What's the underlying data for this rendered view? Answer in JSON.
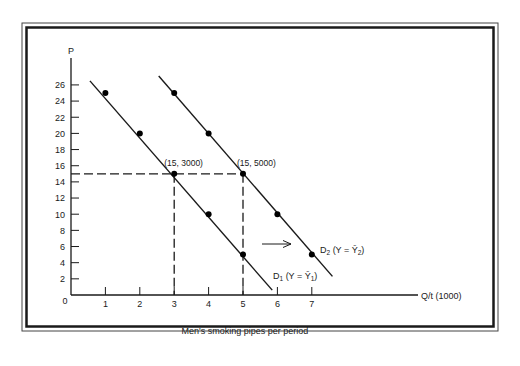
{
  "chart_data": {
    "type": "line",
    "title": "",
    "xlabel": "Men's smoking pipes per period",
    "x_axis_label": "Q/t (1000)",
    "y_axis_label": "P",
    "xlim": [
      0,
      8
    ],
    "ylim": [
      0,
      28
    ],
    "x_ticks": [
      1,
      2,
      3,
      4,
      5,
      6,
      7
    ],
    "y_ticks": [
      2,
      4,
      6,
      8,
      10,
      12,
      14,
      16,
      18,
      20,
      22,
      24,
      26
    ],
    "origin_label": "0",
    "grid": false,
    "series": [
      {
        "name": "D1 (Y = Ȳ1)",
        "label_main": "D",
        "label_sub": "1",
        "label_rest": " (Y = Ȳ",
        "label_sub2": "1",
        "label_end": ")",
        "line": [
          [
            0.55,
            26.5
          ],
          [
            5.85,
            0.6
          ]
        ],
        "points": [
          [
            1,
            25
          ],
          [
            2,
            20
          ],
          [
            3,
            15
          ],
          [
            4,
            10
          ],
          [
            5,
            5
          ]
        ]
      },
      {
        "name": "D2 (Y = Ȳ2)",
        "label_main": "D",
        "label_sub": "2",
        "label_rest": " (Y = Ȳ",
        "label_sub2": "2",
        "label_end": ")",
        "line": [
          [
            2.55,
            27.1
          ],
          [
            7.6,
            2.3
          ]
        ],
        "points": [
          [
            3,
            25
          ],
          [
            4,
            20
          ],
          [
            5,
            15
          ],
          [
            6,
            10
          ],
          [
            7,
            5
          ]
        ]
      }
    ],
    "annotations": [
      {
        "text": "(15, 3000)",
        "x": 3,
        "y": 15
      },
      {
        "text": "(15, 5000)",
        "x": 5,
        "y": 15
      }
    ],
    "reference_lines": {
      "horizontal": {
        "y": 15,
        "x_to": 5
      },
      "vertical": [
        {
          "x": 3,
          "y_to": 15
        },
        {
          "x": 5,
          "y_to": 15
        }
      ]
    },
    "shift_arrow": {
      "from_x": 5.8,
      "to_x": 6.45,
      "y": 5.5,
      "direction": "right"
    }
  }
}
